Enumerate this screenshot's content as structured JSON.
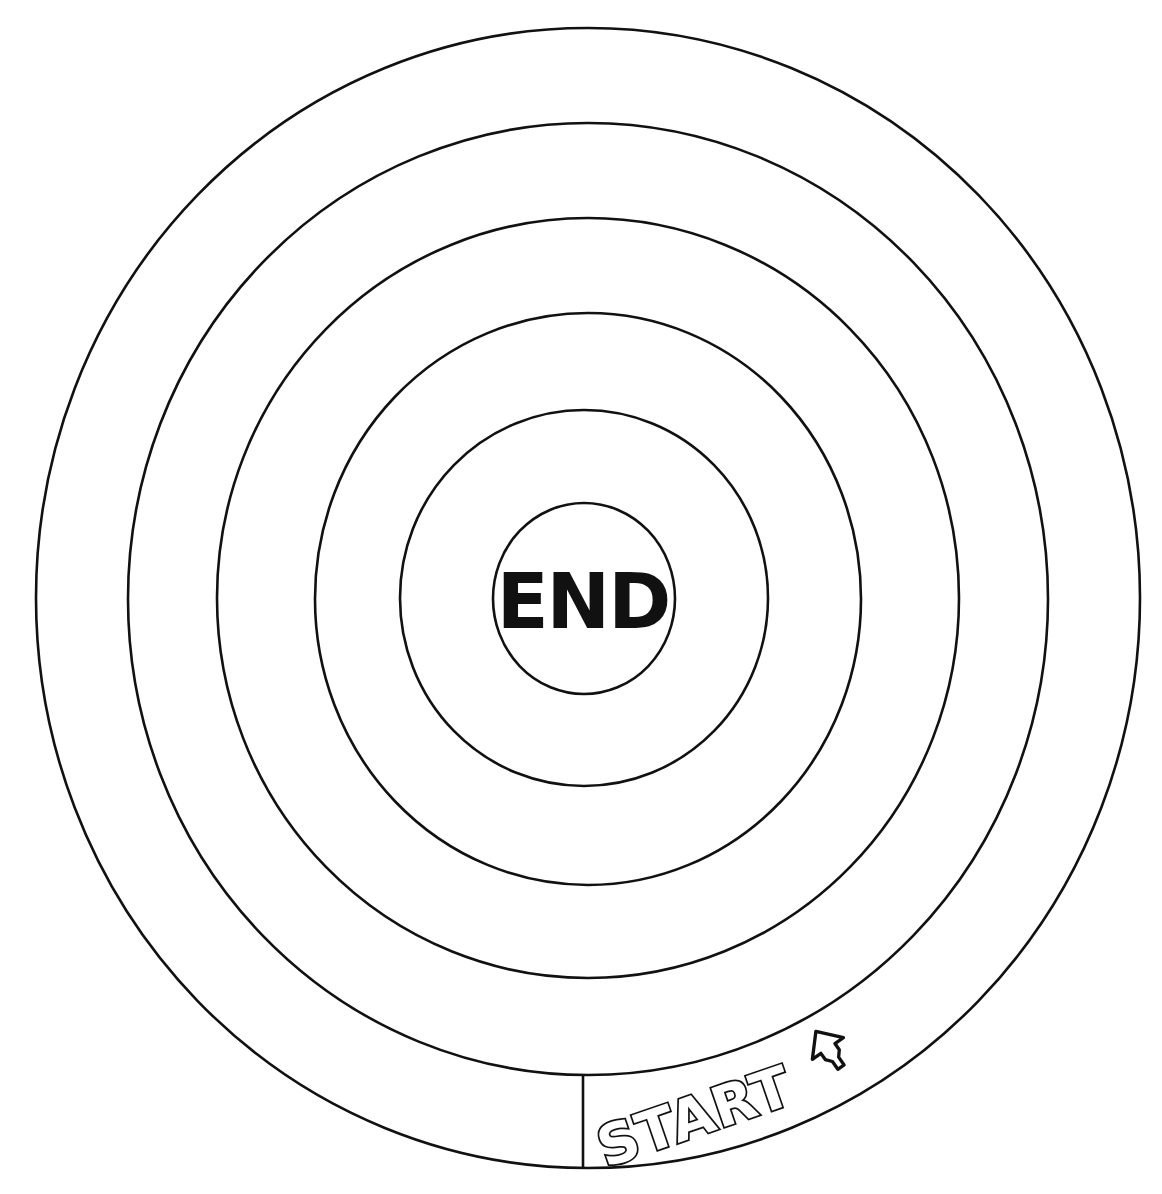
{
  "game": {
    "type": "concentric-ring maze / race track board",
    "center_label": "END",
    "start_label": "START",
    "start_arrow": "arrow-up-right-icon",
    "ring_count": 6,
    "colors": {
      "background": "#ffffff",
      "line": "#111111",
      "text": "#111111"
    }
  }
}
